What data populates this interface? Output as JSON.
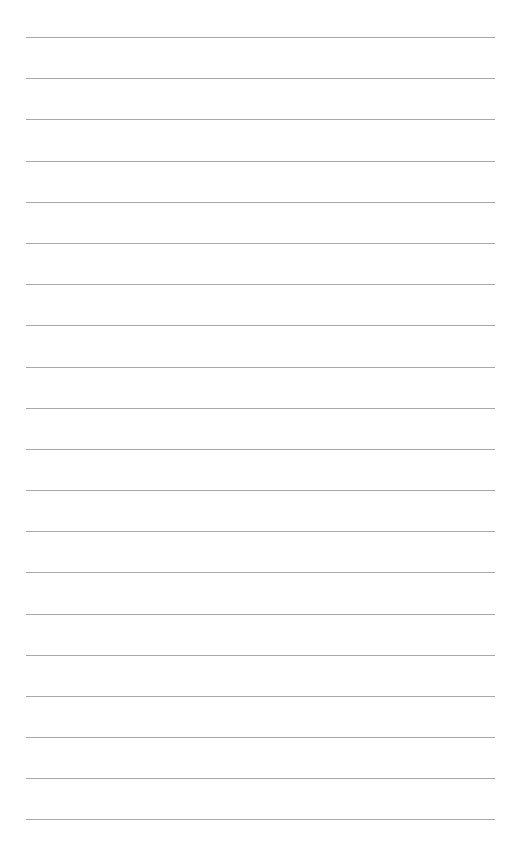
{
  "page": {
    "type": "lined-paper",
    "background": "#ffffff",
    "line_color": "#9a9a9a",
    "line_count": 20,
    "line_start_x": 26,
    "line_end_x": 495,
    "first_line_y": 37,
    "line_spacing": 41.2,
    "lines": [
      37,
      78,
      119,
      161,
      202,
      243,
      284,
      325,
      367,
      408,
      449,
      490,
      531,
      572,
      614,
      655,
      696,
      737,
      778,
      819
    ]
  }
}
